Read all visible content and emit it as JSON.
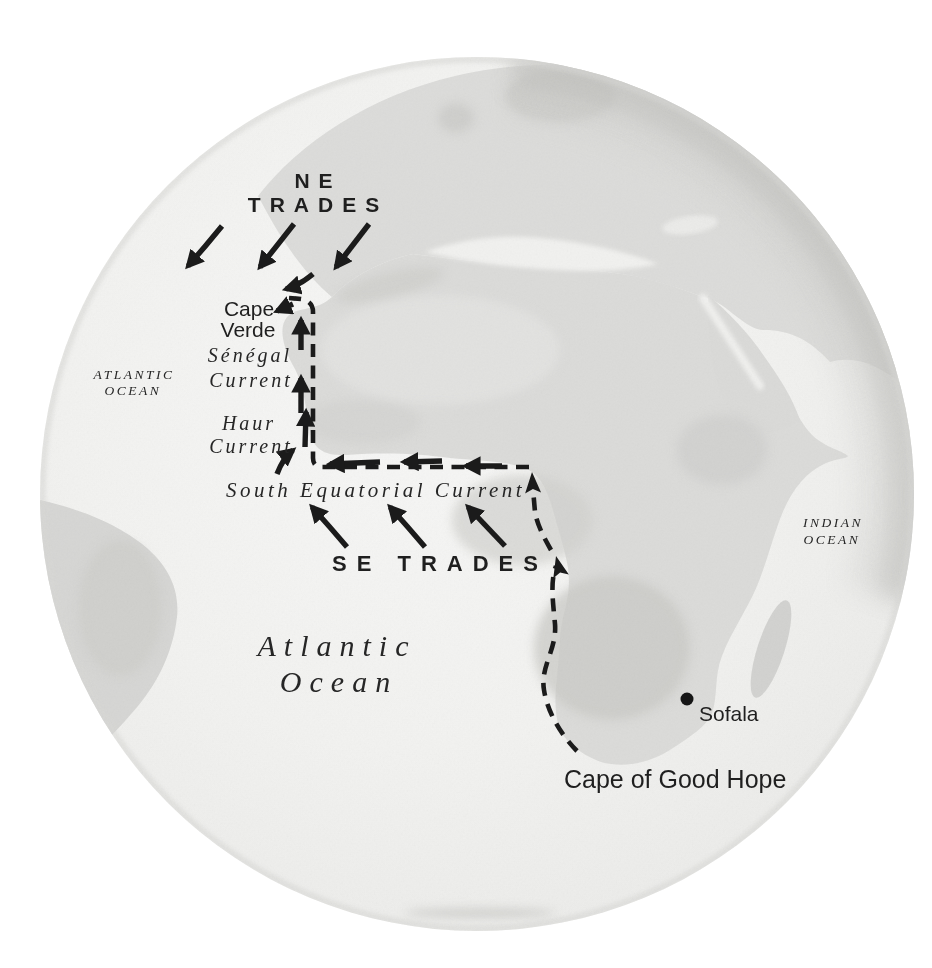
{
  "map": {
    "type": "historical-globe-map",
    "subject": "Atlantic winds, currents and sea route along the African coast",
    "labels": {
      "ne_trades": [
        "NE",
        "TRADES"
      ],
      "se_trades": "SE TRADES",
      "cape_verde": [
        "Cape",
        "Verde"
      ],
      "senegal_current": [
        "Sénégal",
        "Current"
      ],
      "haur_current": [
        "Haur",
        "Current"
      ],
      "south_equatorial_current": "South Equatorial Current",
      "atlantic_ocean_small": [
        "ATLANTIC",
        "OCEAN"
      ],
      "atlantic_ocean_large": [
        "Atlantic",
        "Ocean"
      ],
      "indian_ocean": [
        "INDIAN",
        "OCEAN"
      ],
      "sofala": "Sofala",
      "cape_of_good_hope": "Cape of Good Hope"
    },
    "symbols": {
      "route_line": "dashed black line from Cape of Good Hope north along west African coast to Cape Verde",
      "ne_trades_arrows_direction": "southwest",
      "se_trades_arrows_direction": "northwest",
      "south_equatorial_current_arrows_direction": "west",
      "coastal_current_arrows_direction": "north",
      "sofala_marker": "filled dot"
    },
    "colors": {
      "ink": "#1f1f1f",
      "land": "#dcdcda",
      "land_shade": "#c7c7c4",
      "ocean": "#f1f1ef",
      "page": "#ffffff"
    }
  }
}
